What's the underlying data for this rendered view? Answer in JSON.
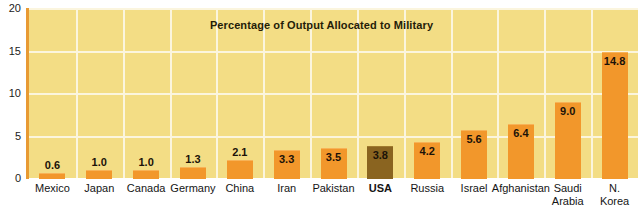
{
  "chart_data": {
    "type": "bar",
    "title": "Percentage of Output Allocated to Military",
    "xlabel": "",
    "ylabel": "",
    "ylim": [
      0,
      20
    ],
    "yticks": [
      "0",
      "5",
      "10",
      "15",
      "20"
    ],
    "grid": true,
    "legend": "none",
    "categories": [
      "Mexico",
      "Japan",
      "Canada",
      "Germany",
      "China",
      "Iran",
      "Pakistan",
      "USA",
      "Russia",
      "Israel",
      "Afghanistan",
      "Saudi\nArabia",
      "N. Korea"
    ],
    "values": [
      0.6,
      1.0,
      1.0,
      1.3,
      2.1,
      3.3,
      3.5,
      3.8,
      4.2,
      5.6,
      6.4,
      9.0,
      14.8
    ],
    "value_labels": [
      "0.6",
      "1.0",
      "1.0",
      "1.3",
      "2.1",
      "3.3",
      "3.5",
      "3.8",
      "4.2",
      "5.6",
      "6.4",
      "9.0",
      "14.8"
    ],
    "highlight_index": 7,
    "colors": {
      "plot_background": "#F3DD85",
      "gridline": "#FBF5DE",
      "bar": "#F2972B",
      "bar_highlight": "#8A6420",
      "axis_line": "#E89A33",
      "text": "#1b1b1b",
      "page_background": "#FFFFFF"
    }
  }
}
